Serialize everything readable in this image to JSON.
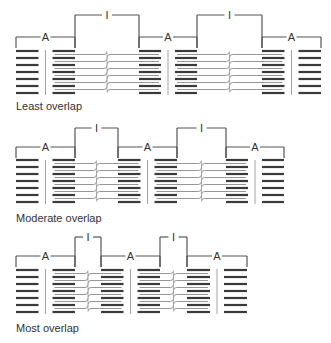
{
  "colors": {
    "thick": "#3a3a3a",
    "thin": "#8a8a8a",
    "bracket": "#555555",
    "text": "#333333"
  },
  "band_labels": {
    "a_band": "A",
    "i_band": "I"
  },
  "panels": [
    {
      "name": "least-overlap",
      "caption": "Least overlap",
      "caption_y": 100,
      "i_top_y": 15,
      "a_line_y": 37,
      "bracket_bottom_y": 48,
      "row_y0": 51,
      "row_step": 7,
      "rows": 7,
      "a_bands": [
        [
          16,
          75
        ],
        [
          139,
          197
        ],
        [
          262,
          321
        ]
      ],
      "i_bands": [
        [
          75,
          139
        ],
        [
          197,
          262
        ]
      ]
    },
    {
      "name": "moderate-overlap",
      "caption": "Moderate overlap",
      "caption_y": 212,
      "i_top_y": 128,
      "a_line_y": 147,
      "bracket_bottom_y": 158,
      "row_y0": 160,
      "row_step": 7,
      "rows": 7,
      "a_bands": [
        [
          16,
          75
        ],
        [
          118,
          177
        ],
        [
          226,
          284
        ]
      ],
      "i_bands": [
        [
          75,
          118
        ],
        [
          177,
          226
        ]
      ]
    },
    {
      "name": "most-overlap",
      "caption": "Most overlap",
      "caption_y": 322,
      "i_top_y": 237,
      "a_line_y": 256,
      "bracket_bottom_y": 267,
      "row_y0": 270,
      "row_step": 7,
      "rows": 7,
      "a_bands": [
        [
          16,
          75
        ],
        [
          101,
          160
        ],
        [
          187,
          247
        ]
      ],
      "i_bands": [
        [
          75,
          101
        ],
        [
          160,
          187
        ]
      ]
    }
  ]
}
